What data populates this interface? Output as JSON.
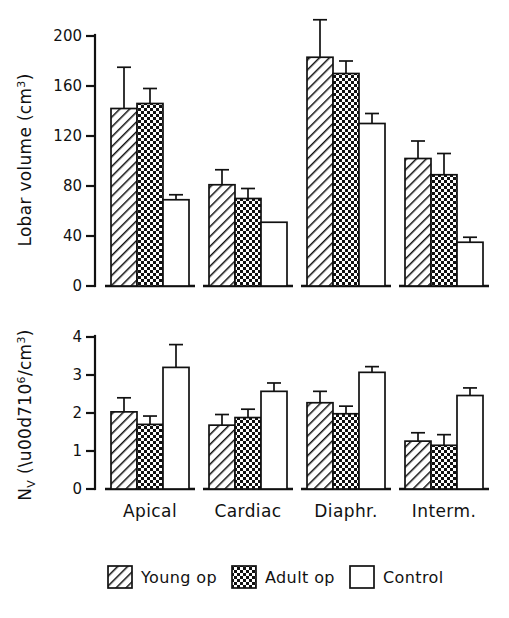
{
  "figure": {
    "background": "#ffffff",
    "ink_color": "#111111"
  },
  "legend": {
    "position": "bottom-center",
    "items": [
      {
        "label": "Young op",
        "pattern": "diagonal-hatch"
      },
      {
        "label": "Adult op",
        "pattern": "dotted-checker"
      },
      {
        "label": "Control",
        "pattern": "solid-white"
      }
    ]
  },
  "categories": [
    "Apical",
    "Cardiac",
    "Diaphr.",
    "Interm."
  ],
  "chart_data": [
    {
      "type": "bar",
      "id": "lobar-volume",
      "title": "",
      "xlabel": "",
      "ylabel": "Lobar volume (cm3)",
      "ylabel_parts": {
        "main": "Lobar volume  (cm",
        "sup": "3",
        "tail": ")"
      },
      "ylim": [
        0,
        200
      ],
      "yticks": [
        0,
        40,
        80,
        120,
        160,
        200
      ],
      "ytick_labels": [
        "0",
        "40",
        "80",
        "120",
        "160",
        "200"
      ],
      "grid": false,
      "errorbar_style": "upper-only-with-cap",
      "categories": [
        "Apical",
        "Cardiac",
        "Diaphr.",
        "Interm."
      ],
      "series": [
        {
          "name": "Young op",
          "pattern": "diagonal-hatch",
          "values": [
            142,
            81,
            183,
            102
          ],
          "errors": [
            33,
            12,
            30,
            14
          ]
        },
        {
          "name": "Adult op",
          "pattern": "dotted-checker",
          "values": [
            146,
            70,
            170,
            89
          ],
          "errors": [
            12,
            8,
            10,
            17
          ]
        },
        {
          "name": "Control",
          "pattern": "solid-white",
          "values": [
            69,
            51,
            130,
            35
          ],
          "errors": [
            4,
            0,
            8,
            4
          ]
        }
      ]
    },
    {
      "type": "bar",
      "id": "nv-density",
      "title": "",
      "xlabel": "",
      "ylabel": "Nv (x10^6/cm3)",
      "ylabel_parts": {
        "pre": "N",
        "sub": "V",
        "mid": " (×10",
        "sup": "6",
        "tail": "/cm",
        "sup2": "3",
        "end": ")"
      },
      "ylim": [
        0,
        4
      ],
      "yticks": [
        0,
        1,
        2,
        3,
        4
      ],
      "ytick_labels": [
        "0",
        "1",
        "2",
        "3",
        "4"
      ],
      "grid": false,
      "errorbar_style": "upper-only-with-cap",
      "categories": [
        "Apical",
        "Cardiac",
        "Diaphr.",
        "Interm."
      ],
      "series": [
        {
          "name": "Young op",
          "pattern": "diagonal-hatch",
          "values": [
            2.03,
            1.68,
            2.27,
            1.26
          ],
          "errors": [
            0.37,
            0.28,
            0.3,
            0.22
          ]
        },
        {
          "name": "Adult op",
          "pattern": "dotted-checker",
          "values": [
            1.7,
            1.88,
            1.98,
            1.15
          ],
          "errors": [
            0.22,
            0.22,
            0.2,
            0.28
          ]
        },
        {
          "name": "Control",
          "pattern": "solid-white",
          "values": [
            3.2,
            2.57,
            3.07,
            2.46
          ],
          "errors": [
            0.6,
            0.22,
            0.15,
            0.2
          ]
        }
      ]
    }
  ]
}
